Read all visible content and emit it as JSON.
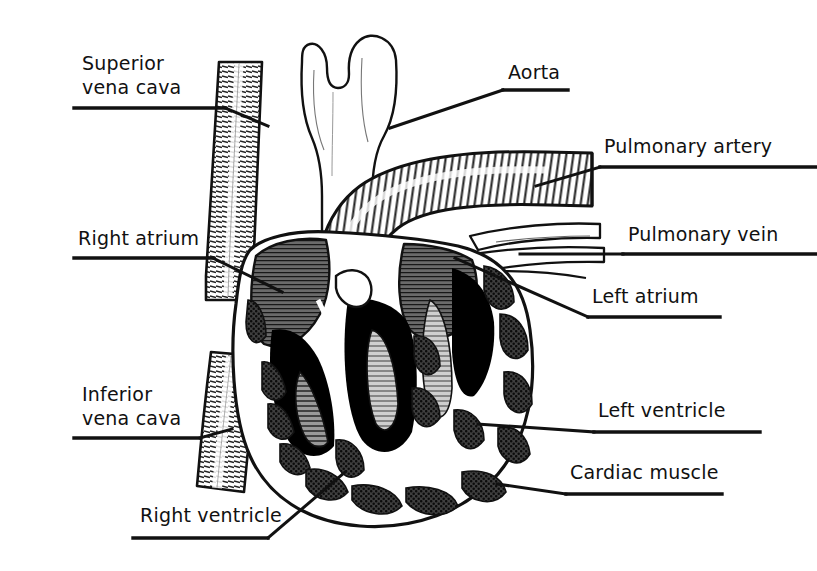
{
  "figure": {
    "title": "Cross-section of the human heart",
    "type": "anatomical-line-diagram",
    "background_color": "#ffffff",
    "ink_color": "#111111",
    "width": 817,
    "height": 571
  },
  "palette": {
    "ink": "#111111",
    "paper": "#ffffff",
    "chamber_lumen": "#000000",
    "myocardium_stipple": "#4a4a4a",
    "atrium_fill": "#585858",
    "papillary_gray": "#8d8d8d",
    "vessel_white": "#ffffff",
    "hatch_gray": "#3b3b3b"
  },
  "labels": [
    {
      "id": "superior-vena-cava",
      "text_lines": [
        "Superior",
        "vena cava"
      ],
      "text": "Superior vena cava",
      "side": "left",
      "x": 82,
      "y": 52,
      "rule": {
        "x1": 74,
        "y1": 108,
        "x2": 225,
        "y2": 108
      },
      "leader": [
        [
          225,
          108
        ],
        [
          268,
          126
        ]
      ]
    },
    {
      "id": "right-atrium",
      "text_lines": [
        "Right atrium"
      ],
      "text": "Right atrium",
      "side": "left",
      "x": 78,
      "y": 228,
      "rule": {
        "x1": 74,
        "y1": 258,
        "x2": 213,
        "y2": 258
      },
      "leader": [
        [
          213,
          258
        ],
        [
          282,
          292
        ]
      ]
    },
    {
      "id": "inferior-vena-cava",
      "text_lines": [
        "Inferior",
        "vena cava"
      ],
      "text": "Inferior vena cava",
      "side": "left",
      "x": 82,
      "y": 383,
      "rule": {
        "x1": 74,
        "y1": 438,
        "x2": 200,
        "y2": 438
      },
      "leader": [
        [
          200,
          438
        ],
        [
          232,
          429
        ]
      ]
    },
    {
      "id": "right-ventricle",
      "text_lines": [
        "Right ventricle"
      ],
      "text": "Right ventricle",
      "side": "left",
      "x": 140,
      "y": 505,
      "rule": {
        "x1": 133,
        "y1": 538,
        "x2": 268,
        "y2": 538
      },
      "leader": [
        [
          268,
          538
        ],
        [
          345,
          472
        ]
      ]
    },
    {
      "id": "aorta",
      "text_lines": [
        "Aorta"
      ],
      "text": "Aorta",
      "side": "right",
      "x": 508,
      "y": 62,
      "rule": {
        "x1": 503,
        "y1": 90,
        "x2": 568,
        "y2": 90
      },
      "leader": [
        [
          503,
          90
        ],
        [
          390,
          128
        ]
      ]
    },
    {
      "id": "pulmonary-artery",
      "text_lines": [
        "Pulmonary artery"
      ],
      "text": "Pulmonary artery",
      "side": "right",
      "x": 604,
      "y": 136,
      "rule": {
        "x1": 600,
        "y1": 167,
        "x2": 817,
        "y2": 167
      },
      "leader": [
        [
          600,
          167
        ],
        [
          536,
          186
        ]
      ]
    },
    {
      "id": "pulmonary-vein",
      "text_lines": [
        "Pulmonary vein"
      ],
      "text": "Pulmonary vein",
      "side": "right",
      "x": 628,
      "y": 224,
      "rule": {
        "x1": 623,
        "y1": 254,
        "x2": 817,
        "y2": 254
      },
      "leader": [
        [
          623,
          254
        ],
        [
          520,
          254
        ]
      ]
    },
    {
      "id": "left-atrium",
      "text_lines": [
        "Left atrium"
      ],
      "text": "Left atrium",
      "side": "right",
      "x": 592,
      "y": 286,
      "rule": {
        "x1": 588,
        "y1": 317,
        "x2": 720,
        "y2": 317
      },
      "leader": [
        [
          588,
          317
        ],
        [
          455,
          258
        ]
      ]
    },
    {
      "id": "left-ventricle",
      "text_lines": [
        "Left ventricle"
      ],
      "text": "Left ventricle",
      "side": "right",
      "x": 598,
      "y": 400,
      "rule": {
        "x1": 594,
        "y1": 432,
        "x2": 760,
        "y2": 432
      },
      "leader": [
        [
          594,
          432
        ],
        [
          478,
          424
        ]
      ]
    },
    {
      "id": "cardiac-muscle",
      "text_lines": [
        "Cardiac muscle"
      ],
      "text": "Cardiac muscle",
      "side": "right",
      "x": 570,
      "y": 462,
      "rule": {
        "x1": 566,
        "y1": 494,
        "x2": 722,
        "y2": 494
      },
      "leader": [
        [
          566,
          494
        ],
        [
          497,
          484
        ]
      ]
    }
  ],
  "structures": [
    {
      "id": "superior-vena-cava",
      "name": "Superior vena cava",
      "texture": "horizontal-hatch"
    },
    {
      "id": "inferior-vena-cava",
      "name": "Inferior vena cava",
      "texture": "horizontal-hatch"
    },
    {
      "id": "aorta",
      "name": "Aorta",
      "texture": "outline-white"
    },
    {
      "id": "pulmonary-artery",
      "name": "Pulmonary artery",
      "texture": "ribbed-hatch"
    },
    {
      "id": "pulmonary-vein",
      "name": "Pulmonary vein",
      "texture": "outline-white"
    },
    {
      "id": "right-atrium",
      "name": "Right atrium",
      "texture": "dark-fine-hatch"
    },
    {
      "id": "left-atrium",
      "name": "Left atrium",
      "texture": "dark-fine-hatch"
    },
    {
      "id": "right-ventricle",
      "name": "Right ventricle",
      "texture": "black-lumen"
    },
    {
      "id": "left-ventricle",
      "name": "Left ventricle",
      "texture": "black-lumen"
    },
    {
      "id": "cardiac-muscle",
      "name": "Cardiac muscle",
      "texture": "stipple-blocks"
    }
  ]
}
